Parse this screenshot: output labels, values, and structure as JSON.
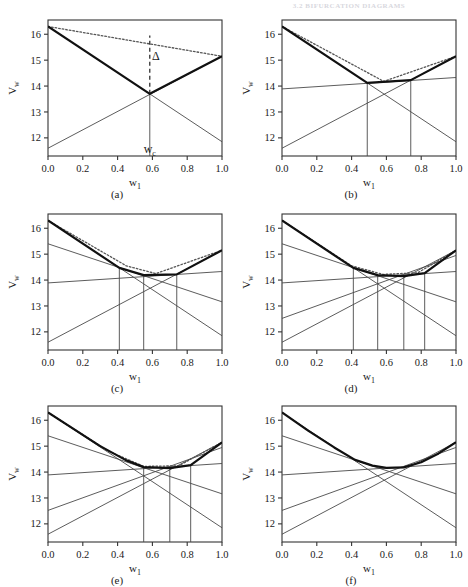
{
  "header": {
    "text": "3.2   BIFURCATION DIAGRAMS"
  },
  "figure": {
    "axis": {
      "xlabel": "w",
      "xlabel_sub": "1",
      "ylabel": "V",
      "ylabel_sub": "w",
      "xticks": [
        "0.0",
        "0.2",
        "0.4",
        "0.6",
        "0.8",
        "1.0"
      ],
      "xtick_values": [
        0.0,
        0.2,
        0.4,
        0.6,
        0.8,
        1.0
      ],
      "yticks": [
        "12",
        "13",
        "14",
        "15",
        "16"
      ],
      "ytick_values": [
        12,
        13,
        14,
        15,
        16
      ],
      "xlim": [
        0.0,
        1.0
      ],
      "ylim": [
        11.3,
        16.55
      ],
      "grid": false
    },
    "panels": [
      {
        "id": "a",
        "caption": "(a)",
        "chart_data": {
          "type": "line",
          "title": "",
          "xlabel": "w1",
          "ylabel": "Vw",
          "xlim": [
            0.0,
            1.0
          ],
          "ylim": [
            11.3,
            16.55
          ],
          "series": [
            {
              "name": "line-1",
              "style": "thin",
              "x": [
                0.0,
                1.0
              ],
              "y": [
                16.3,
                11.85
              ]
            },
            {
              "name": "line-2",
              "style": "thin",
              "x": [
                0.0,
                1.0
              ],
              "y": [
                11.6,
                15.15
              ]
            }
          ],
          "envelope": {
            "name": "lower-envelope",
            "style": "thick",
            "x": [
              0.0,
              0.585,
              1.0
            ],
            "y": [
              16.3,
              13.7,
              15.15
            ]
          },
          "chord": {
            "name": "dotted-chord",
            "style": "dotted",
            "x": [
              0.0,
              1.0
            ],
            "y": [
              16.3,
              15.15
            ]
          },
          "verticals": [
            0.585
          ],
          "annotations": [
            {
              "name": "delta",
              "text": "Δ",
              "x": 0.62,
              "y": 15.0
            },
            {
              "name": "wc",
              "text": "w",
              "sub": "c",
              "x": 0.585,
              "y": 11.42
            }
          ],
          "delta_bar": {
            "x": 0.585,
            "y0": 13.7,
            "y1": 15.95
          }
        }
      },
      {
        "id": "b",
        "caption": "(b)",
        "chart_data": {
          "type": "line",
          "title": "",
          "xlabel": "w1",
          "ylabel": "Vw",
          "xlim": [
            0.0,
            1.0
          ],
          "ylim": [
            11.3,
            16.55
          ],
          "series": [
            {
              "name": "line-1",
              "style": "thin",
              "x": [
                0.0,
                1.0
              ],
              "y": [
                16.3,
                11.85
              ]
            },
            {
              "name": "line-2",
              "style": "thin",
              "x": [
                0.0,
                1.0
              ],
              "y": [
                11.6,
                15.15
              ]
            },
            {
              "name": "line-3",
              "style": "thin",
              "x": [
                0.0,
                1.0
              ],
              "y": [
                13.89,
                14.33
              ]
            }
          ],
          "envelope": {
            "name": "lower-envelope",
            "style": "thick",
            "x": [
              0.0,
              0.49,
              0.74,
              1.0
            ],
            "y": [
              16.3,
              14.12,
              14.23,
              15.15
            ]
          },
          "chord": {
            "name": "dotted-chord",
            "style": "dotted",
            "x": [
              0.0,
              0.585,
              1.0
            ],
            "y": [
              16.3,
              14.18,
              15.15
            ]
          },
          "verticals": [
            0.49,
            0.74
          ],
          "annotations": [],
          "delta_bar": null
        }
      },
      {
        "id": "c",
        "caption": "(c)",
        "chart_data": {
          "type": "line",
          "title": "",
          "xlabel": "w1",
          "ylabel": "Vw",
          "xlim": [
            0.0,
            1.0
          ],
          "ylim": [
            11.3,
            16.55
          ],
          "series": [
            {
              "name": "line-1",
              "style": "thin",
              "x": [
                0.0,
                1.0
              ],
              "y": [
                16.3,
                11.85
              ]
            },
            {
              "name": "line-2",
              "style": "thin",
              "x": [
                0.0,
                1.0
              ],
              "y": [
                11.6,
                15.15
              ]
            },
            {
              "name": "line-3",
              "style": "thin",
              "x": [
                0.0,
                1.0
              ],
              "y": [
                13.89,
                14.33
              ]
            },
            {
              "name": "line-4",
              "style": "thin",
              "x": [
                0.0,
                1.0
              ],
              "y": [
                15.4,
                13.16
              ]
            }
          ],
          "envelope": {
            "name": "lower-envelope",
            "style": "thick",
            "x": [
              0.0,
              0.41,
              0.55,
              0.74,
              1.0
            ],
            "y": [
              16.3,
              14.47,
              14.19,
              14.22,
              15.15
            ]
          },
          "chord": {
            "name": "dotted-chord",
            "style": "dotted",
            "x": [
              0.0,
              0.45,
              0.62,
              1.0
            ],
            "y": [
              16.3,
              14.55,
              14.25,
              15.15
            ]
          },
          "verticals": [
            0.41,
            0.55,
            0.74
          ],
          "annotations": [],
          "delta_bar": null
        }
      },
      {
        "id": "d",
        "caption": "(d)",
        "chart_data": {
          "type": "line",
          "title": "",
          "xlabel": "w1",
          "ylabel": "Vw",
          "xlim": [
            0.0,
            1.0
          ],
          "ylim": [
            11.3,
            16.55
          ],
          "series": [
            {
              "name": "line-1",
              "style": "thin",
              "x": [
                0.0,
                1.0
              ],
              "y": [
                16.3,
                11.85
              ]
            },
            {
              "name": "line-2",
              "style": "thin",
              "x": [
                0.0,
                1.0
              ],
              "y": [
                11.6,
                15.15
              ]
            },
            {
              "name": "line-3",
              "style": "thin",
              "x": [
                0.0,
                1.0
              ],
              "y": [
                13.89,
                14.33
              ]
            },
            {
              "name": "line-4",
              "style": "thin",
              "x": [
                0.0,
                1.0
              ],
              "y": [
                15.4,
                13.16
              ]
            },
            {
              "name": "line-5",
              "style": "thin",
              "x": [
                0.0,
                1.0
              ],
              "y": [
                12.52,
                14.95
              ]
            }
          ],
          "envelope": {
            "name": "lower-envelope",
            "style": "thick",
            "x": [
              0.0,
              0.41,
              0.55,
              0.7,
              0.82,
              1.0
            ],
            "y": [
              16.3,
              14.47,
              14.19,
              14.15,
              14.27,
              15.15
            ]
          },
          "chord": {
            "name": "dotted-chord",
            "style": "dotted",
            "x": [
              0.0,
              0.4,
              0.58,
              0.78,
              1.0
            ],
            "y": [
              16.3,
              14.55,
              14.22,
              14.28,
              15.15
            ]
          },
          "verticals": [
            0.41,
            0.55,
            0.7,
            0.82
          ],
          "annotations": [],
          "delta_bar": null
        }
      },
      {
        "id": "e",
        "caption": "(e)",
        "chart_data": {
          "type": "line",
          "title": "",
          "xlabel": "w1",
          "ylabel": "Vw",
          "xlim": [
            0.0,
            1.0
          ],
          "ylim": [
            11.3,
            16.55
          ],
          "series": [
            {
              "name": "line-1",
              "style": "thin",
              "x": [
                0.0,
                1.0
              ],
              "y": [
                16.3,
                11.85
              ]
            },
            {
              "name": "line-2",
              "style": "thin",
              "x": [
                0.0,
                1.0
              ],
              "y": [
                11.6,
                15.15
              ]
            },
            {
              "name": "line-3",
              "style": "thin",
              "x": [
                0.0,
                1.0
              ],
              "y": [
                13.89,
                14.33
              ]
            },
            {
              "name": "line-4",
              "style": "thin",
              "x": [
                0.0,
                1.0
              ],
              "y": [
                15.4,
                13.16
              ]
            },
            {
              "name": "line-5",
              "style": "thin",
              "x": [
                0.0,
                1.0
              ],
              "y": [
                12.52,
                14.95
              ]
            }
          ],
          "envelope": {
            "name": "lower-envelope",
            "style": "thick",
            "x": [
              0.0,
              0.3,
              0.45,
              0.55,
              0.7,
              0.82,
              1.0
            ],
            "y": [
              16.3,
              15.0,
              14.45,
              14.19,
              14.15,
              14.27,
              15.15
            ]
          },
          "chord": {
            "name": "dotted-chord",
            "style": "dotted",
            "x": [
              0.0,
              0.35,
              0.55,
              0.75,
              1.0
            ],
            "y": [
              16.3,
              14.8,
              14.22,
              14.24,
              15.15
            ]
          },
          "verticals": [
            0.55,
            0.7,
            0.82
          ],
          "annotations": [],
          "delta_bar": null
        }
      },
      {
        "id": "f",
        "caption": "(f)",
        "chart_data": {
          "type": "line",
          "title": "",
          "xlabel": "w1",
          "ylabel": "Vw",
          "xlim": [
            0.0,
            1.0
          ],
          "ylim": [
            11.3,
            16.55
          ],
          "series": [
            {
              "name": "line-1",
              "style": "thin",
              "x": [
                0.0,
                1.0
              ],
              "y": [
                16.3,
                11.85
              ]
            },
            {
              "name": "line-2",
              "style": "thin",
              "x": [
                0.0,
                1.0
              ],
              "y": [
                11.6,
                15.15
              ]
            },
            {
              "name": "line-3",
              "style": "thin",
              "x": [
                0.0,
                1.0
              ],
              "y": [
                13.89,
                14.33
              ]
            },
            {
              "name": "line-4",
              "style": "thin",
              "x": [
                0.0,
                1.0
              ],
              "y": [
                15.4,
                13.16
              ]
            },
            {
              "name": "line-5",
              "style": "thin",
              "x": [
                0.0,
                1.0
              ],
              "y": [
                12.52,
                14.95
              ]
            }
          ],
          "envelope": {
            "name": "lower-envelope",
            "style": "thick",
            "x": [
              0.0,
              0.15,
              0.3,
              0.42,
              0.52,
              0.6,
              0.7,
              0.8,
              0.9,
              1.0
            ],
            "y": [
              16.3,
              15.6,
              14.95,
              14.47,
              14.25,
              14.16,
              14.18,
              14.38,
              14.72,
              15.15
            ]
          },
          "chord": null,
          "verticals": [],
          "annotations": [],
          "delta_bar": null
        }
      }
    ]
  },
  "colors": {
    "ink": "#1a1a1a",
    "thin_line": "#4a4a4a",
    "thick_line": "#111111",
    "dotted_line": "#555555",
    "frame": "#333333",
    "header_text": "#d8d8de"
  }
}
